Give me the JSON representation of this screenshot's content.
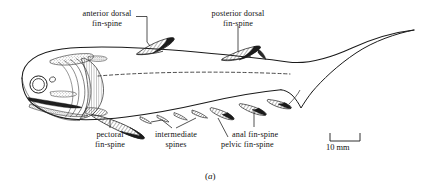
{
  "figure": {
    "caption": "(a)",
    "caption_letter": "a",
    "ink_color": "#1a1a1a",
    "background_color": "#ffffff"
  },
  "labels": [
    {
      "id": "anterior-dorsal-fin-spine",
      "line1": "anterior dorsal",
      "line2": "fin-spine"
    },
    {
      "id": "posterior-dorsal-fin-spine",
      "line1": "posterior dorsal",
      "line2": "fin-spine"
    },
    {
      "id": "pectoral-fin-spine",
      "line1": "pectoral",
      "line2": "fin-spine"
    },
    {
      "id": "intermediate-spines",
      "line1": "intermediate",
      "line2": "spines"
    },
    {
      "id": "anal-fin-spine",
      "line1": "anal fin-spine",
      "line2": ""
    },
    {
      "id": "pelvic-fin-spine",
      "line1": "pelvic fin-spine",
      "line2": ""
    }
  ],
  "scale_bar": {
    "label": "10 mm",
    "value": 10,
    "unit": "mm"
  }
}
